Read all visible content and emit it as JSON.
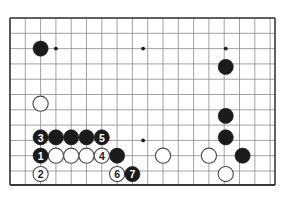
{
  "figure": {
    "kind": "go-board-diagram",
    "title": "",
    "caption": ""
  },
  "board": {
    "left_edge_x": 10,
    "top_edge_y": 18,
    "right_edge_x": 275,
    "bottom_edge_y": 185,
    "grid_spacing": 15.3,
    "columns": 18,
    "rows": 11,
    "border_color": "#3a3a3a",
    "grid_color": "#8b8b8b",
    "background_color": "#ffffff",
    "border_width": 1.6,
    "grid_width": 0.8,
    "partial_right_column": true
  },
  "star_points": [
    {
      "name": "star-point-upper-left",
      "col": 3,
      "row": 2,
      "radius": 1.9
    },
    {
      "name": "star-point-upper-center",
      "col": 8.7,
      "row": 2,
      "radius": 1.9
    },
    {
      "name": "star-point-upper-right",
      "col": 14.1,
      "row": 2,
      "radius": 1.9
    },
    {
      "name": "star-point-lower-center",
      "col": 8.7,
      "row": 8,
      "radius": 1.9
    }
  ],
  "stones": {
    "black_color": "#1b1b1b",
    "white_color": "#ffffff",
    "white_outline_color": "#4a4a4a",
    "radius": 7.6,
    "plain": [
      {
        "name": "black-stone-upper-left",
        "color": "black",
        "col": 2,
        "row": 2
      },
      {
        "name": "white-stone-left-side",
        "color": "white",
        "col": 2,
        "row": 5.6
      },
      {
        "name": "black-stone-row8-c3",
        "color": "black",
        "col": 3,
        "row": 7.8
      },
      {
        "name": "black-stone-row8-c4",
        "color": "black",
        "col": 4,
        "row": 7.8
      },
      {
        "name": "black-stone-row8-c5",
        "color": "black",
        "col": 5,
        "row": 7.8
      },
      {
        "name": "white-stone-row9-c3",
        "color": "white",
        "col": 3,
        "row": 9
      },
      {
        "name": "white-stone-row9-c4",
        "color": "white",
        "col": 4,
        "row": 9
      },
      {
        "name": "white-stone-row9-c5",
        "color": "white",
        "col": 5,
        "row": 9
      },
      {
        "name": "black-stone-row9-c7",
        "color": "black",
        "col": 7,
        "row": 9
      },
      {
        "name": "white-stone-bottom-c10",
        "color": "white",
        "col": 10,
        "row": 9
      },
      {
        "name": "white-stone-bottom-c13",
        "color": "white",
        "col": 13,
        "row": 9
      },
      {
        "name": "black-stone-right-r3",
        "color": "black",
        "col": 14.1,
        "row": 3.2
      },
      {
        "name": "black-stone-right-r6",
        "color": "black",
        "col": 14.1,
        "row": 6.4
      },
      {
        "name": "black-stone-right-r8",
        "color": "black",
        "col": 14.1,
        "row": 7.8
      },
      {
        "name": "black-stone-right-r9",
        "color": "black",
        "col": 15.2,
        "row": 9
      },
      {
        "name": "white-stone-right-r10",
        "color": "white",
        "col": 14.1,
        "row": 10.2
      }
    ],
    "numbered": [
      {
        "name": "move-stone-1",
        "label": "1",
        "color": "black",
        "col": 2,
        "row": 9
      },
      {
        "name": "move-stone-2",
        "label": "2",
        "color": "white",
        "col": 2,
        "row": 10.2
      },
      {
        "name": "move-stone-3",
        "label": "3",
        "color": "black",
        "col": 2,
        "row": 7.8
      },
      {
        "name": "move-stone-4",
        "label": "4",
        "color": "white",
        "col": 6,
        "row": 9
      },
      {
        "name": "move-stone-5",
        "label": "5",
        "color": "black",
        "col": 6,
        "row": 7.8
      },
      {
        "name": "move-stone-6",
        "label": "6",
        "color": "white",
        "col": 7,
        "row": 10.2
      },
      {
        "name": "move-stone-7",
        "label": "7",
        "color": "black",
        "col": 8,
        "row": 10.2
      }
    ]
  }
}
